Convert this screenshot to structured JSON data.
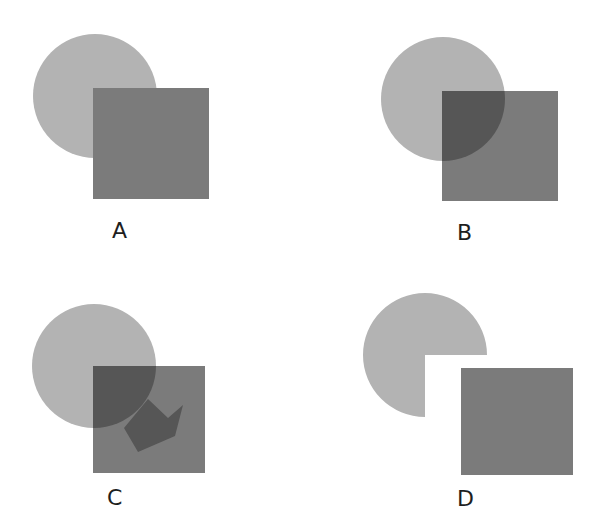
{
  "colors": {
    "background": "#ffffff",
    "circle": "#b3b3b3",
    "square": "#7b7b7b",
    "overlap": "#565656",
    "label": "#1e1e1e"
  },
  "panels": [
    {
      "id": "A",
      "label": "A",
      "label_pos": [
        112,
        220
      ],
      "circle": {
        "cx": 95,
        "cy": 96,
        "r": 62,
        "mode": "behind"
      },
      "square": {
        "x": 93,
        "y": 88,
        "w": 116,
        "h": 111
      },
      "description": "Square drawn on top of circle (opaque occlusion)"
    },
    {
      "id": "B",
      "label": "B",
      "label_pos": [
        457,
        222
      ],
      "circle": {
        "cx": 443,
        "cy": 99,
        "r": 62,
        "mode": "transparent-overlap"
      },
      "square": {
        "x": 442,
        "y": 91,
        "w": 116,
        "h": 110
      },
      "description": "Circle and square overlap with darker intersection (transparency)"
    },
    {
      "id": "C",
      "label": "C",
      "label_pos": [
        107,
        487
      ],
      "circle": {
        "cx": 94,
        "cy": 366,
        "r": 62,
        "mode": "transparent-overlap-arrow"
      },
      "square": {
        "x": 93,
        "y": 366,
        "w": 112,
        "h": 107
      },
      "arrow": [
        [
          148,
          399
        ],
        [
          168,
          418
        ],
        [
          183,
          405
        ],
        [
          175,
          436
        ],
        [
          138,
          452
        ],
        [
          124,
          428
        ]
      ],
      "description": "Overlap region with arrow-shaped dark region extending into square"
    },
    {
      "id": "D",
      "label": "D",
      "label_pos": [
        457,
        488
      ],
      "circle": {
        "cx": 425,
        "cy": 355,
        "r": 62,
        "mode": "cutout-quadrant"
      },
      "square": {
        "x": 461,
        "y": 368,
        "w": 112,
        "h": 107
      },
      "description": "Circle with lower-right quadrant missing, square separated"
    }
  ]
}
